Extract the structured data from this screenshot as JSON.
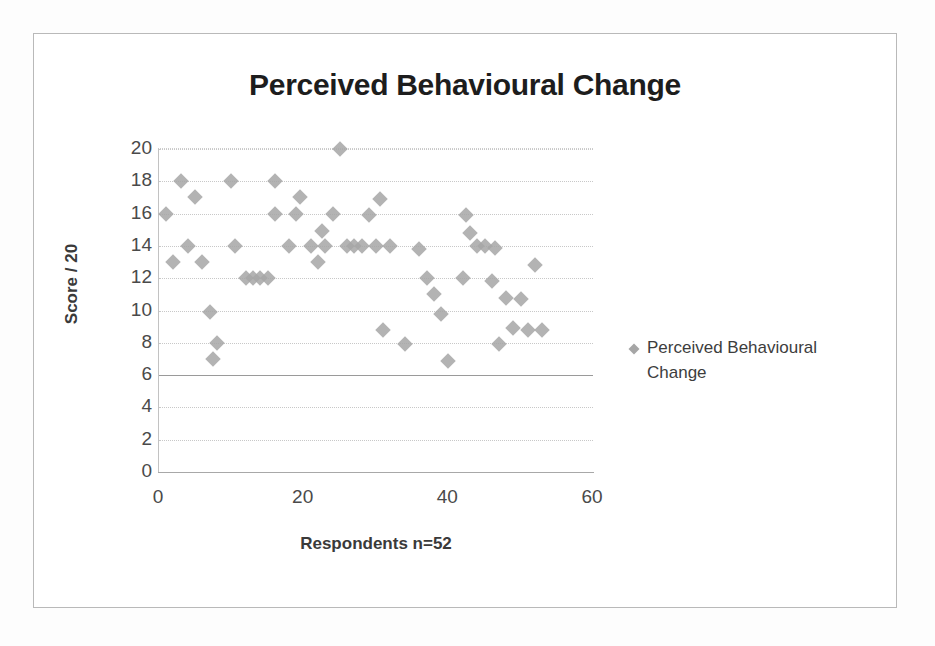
{
  "chart_data": {
    "type": "scatter",
    "title": "Perceived Behavioural Change",
    "xlabel": "Respondents n=52",
    "ylabel": "Score / 20",
    "xlim": [
      0,
      60
    ],
    "ylim": [
      0,
      20
    ],
    "xticks": [
      0,
      20,
      40,
      60
    ],
    "yticks": [
      0,
      2,
      4,
      6,
      8,
      10,
      12,
      14,
      16,
      18,
      20
    ],
    "grid": true,
    "legend_position": "right",
    "series": [
      {
        "name": "Perceived Behavioural Change",
        "marker": "diamond",
        "color": "#a6a6a6",
        "points": [
          [
            1,
            16.0
          ],
          [
            2,
            13.0
          ],
          [
            3,
            18.0
          ],
          [
            4,
            14.0
          ],
          [
            5,
            17.0
          ],
          [
            6,
            13.0
          ],
          [
            7,
            9.9
          ],
          [
            7.5,
            7.0
          ],
          [
            8,
            8.0
          ],
          [
            10,
            18.0
          ],
          [
            10.5,
            14.0
          ],
          [
            12,
            12.0
          ],
          [
            13,
            12.0
          ],
          [
            14,
            12.0
          ],
          [
            15,
            12.0
          ],
          [
            16,
            18.0
          ],
          [
            16,
            16.0
          ],
          [
            18,
            14.0
          ],
          [
            19,
            16.0
          ],
          [
            19.5,
            17.0
          ],
          [
            21,
            14.0
          ],
          [
            22,
            13.0
          ],
          [
            22.5,
            14.9
          ],
          [
            23,
            14.0
          ],
          [
            24,
            16.0
          ],
          [
            25,
            20.0
          ],
          [
            26,
            14.0
          ],
          [
            27,
            14.0
          ],
          [
            28,
            14.0
          ],
          [
            29,
            15.9
          ],
          [
            30,
            14.0
          ],
          [
            30.5,
            16.9
          ],
          [
            31,
            8.8
          ],
          [
            32,
            14.0
          ],
          [
            34,
            7.9
          ],
          [
            36,
            13.8
          ],
          [
            37,
            12.0
          ],
          [
            38,
            11.0
          ],
          [
            39,
            9.8
          ],
          [
            40,
            6.9
          ],
          [
            42,
            12.0
          ],
          [
            42.5,
            15.9
          ],
          [
            43,
            14.8
          ],
          [
            44,
            14.0
          ],
          [
            45,
            14.0
          ],
          [
            46,
            11.8
          ],
          [
            46.5,
            13.9
          ],
          [
            47,
            7.9
          ],
          [
            48,
            10.8
          ],
          [
            49,
            8.9
          ],
          [
            50,
            10.7
          ],
          [
            51,
            8.8
          ],
          [
            52,
            12.8
          ],
          [
            53,
            8.8
          ]
        ]
      }
    ]
  },
  "legend": {
    "label": "Perceived Behavioural Change",
    "marker_name": "diamond-marker"
  }
}
